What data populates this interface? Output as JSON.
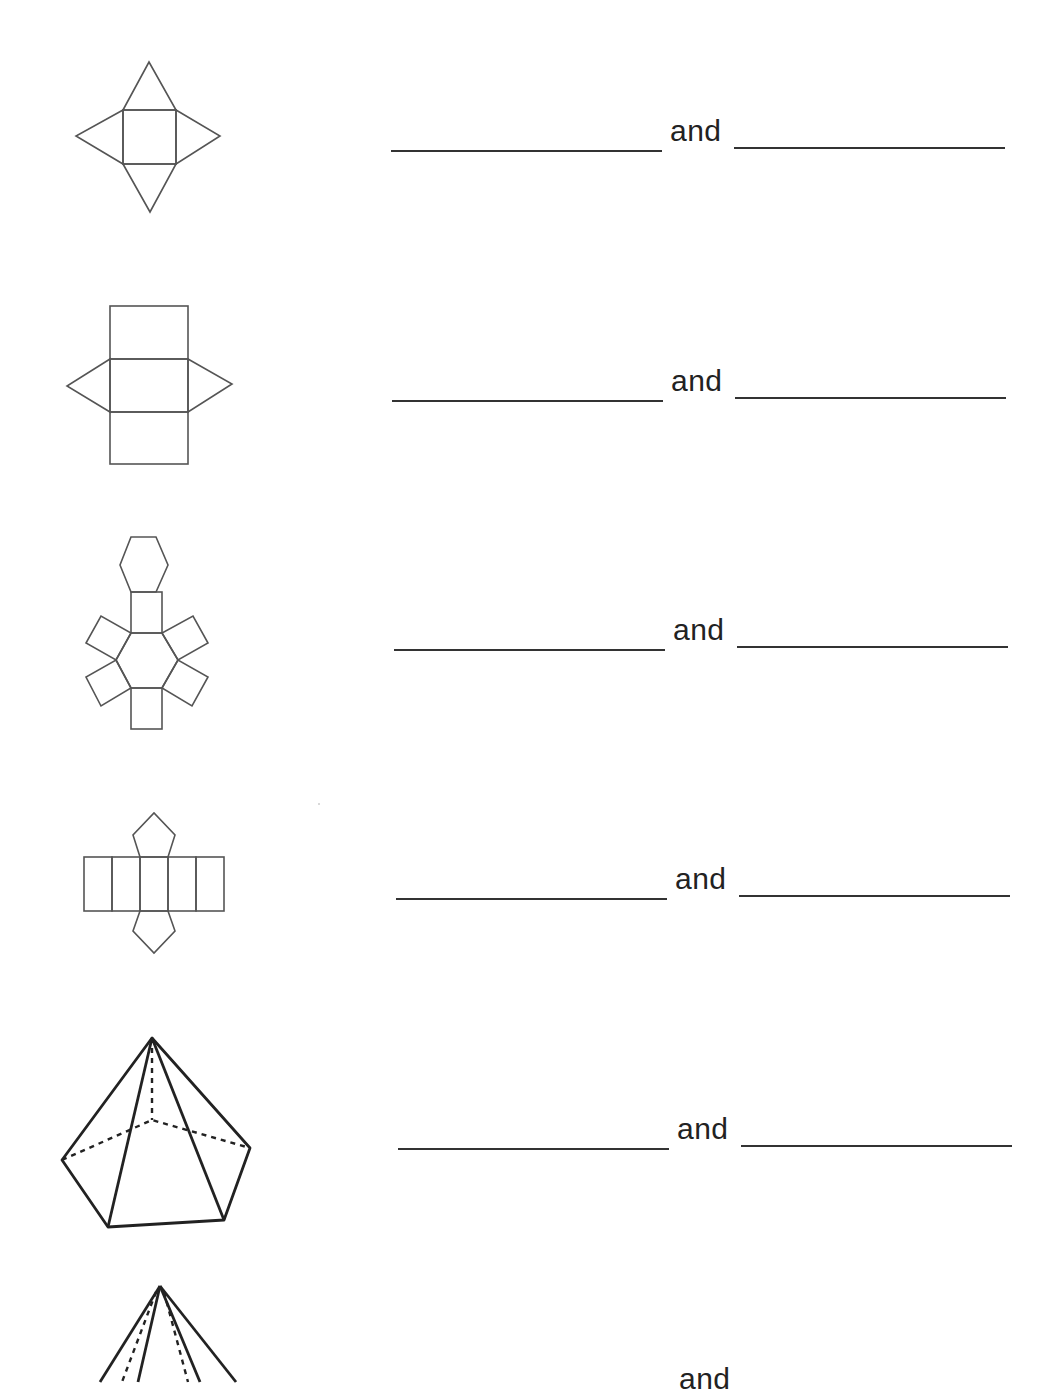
{
  "worksheet": {
    "rows": [
      {
        "figure": "square-pyramid-net",
        "connector": "and",
        "blank1": "",
        "blank2": ""
      },
      {
        "figure": "triangular-prism-net",
        "connector": "and",
        "blank1": "",
        "blank2": ""
      },
      {
        "figure": "hexagonal-prism-net",
        "connector": "and",
        "blank1": "",
        "blank2": ""
      },
      {
        "figure": "pentagonal-prism-net",
        "connector": "and",
        "blank1": "",
        "blank2": ""
      },
      {
        "figure": "pentagonal-pyramid-solid",
        "connector": "and",
        "blank1": "",
        "blank2": ""
      },
      {
        "figure": "pyramid-solid-partial",
        "connector": "and",
        "blank1": "",
        "blank2": ""
      }
    ]
  }
}
